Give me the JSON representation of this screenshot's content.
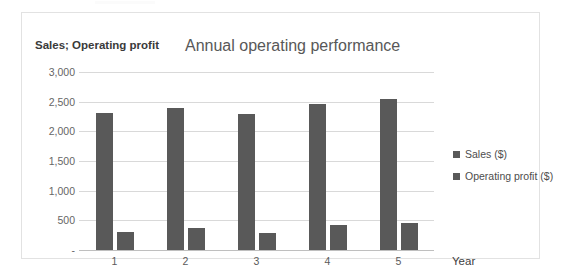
{
  "chart_data": {
    "type": "bar",
    "title": "Annual operating performance",
    "xlabel": "Year",
    "ylabel": "Sales; Operating profit",
    "categories": [
      "1",
      "2",
      "3",
      "4",
      "5"
    ],
    "series": [
      {
        "name": "Sales ($)",
        "values": [
          2310,
          2390,
          2300,
          2460,
          2550
        ],
        "color": "#595959"
      },
      {
        "name": "Operating profit ($)",
        "values": [
          300,
          375,
          290,
          425,
          460
        ],
        "color": "#595959"
      }
    ],
    "ylim": [
      0,
      3000
    ],
    "ytick_values": [
      3000,
      2500,
      2000,
      1500,
      1000,
      500,
      0
    ],
    "ytick_labels": [
      "3,000",
      "2,500",
      "2,000",
      "1,500",
      "1,000",
      "500",
      "-"
    ],
    "grid": true,
    "legend_position": "right",
    "plot_background": "#ffffff",
    "gridline_color": "#d9d9d9"
  },
  "labels": {
    "title": "Annual operating performance",
    "y_axis_title": "Sales; Operating profit",
    "x_axis_title": "Year"
  },
  "legend": {
    "items": [
      {
        "label": "Sales ($)"
      },
      {
        "label": "Operating profit ($)"
      }
    ]
  }
}
